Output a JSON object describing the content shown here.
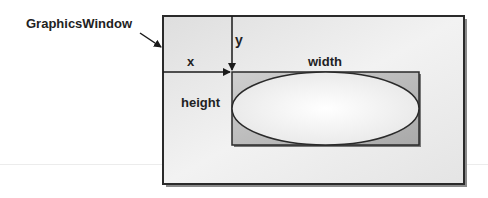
{
  "diagram": {
    "window_label": "GraphicsWindow",
    "x_label": "x",
    "y_label": "y",
    "width_label": "width",
    "height_label": "height"
  },
  "colors": {
    "border": "#2a2a2a",
    "window_fill_light": "#f6f6f6",
    "window_fill_dark": "#d6d6d6",
    "rect_fill": "#b9b9b9",
    "ellipse_fill": "#f4f4f4"
  }
}
